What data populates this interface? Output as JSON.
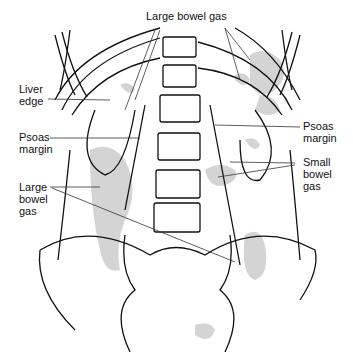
{
  "diagram": {
    "type": "anatomical line drawing - abdominal radiograph",
    "labels": {
      "large_bowel_gas_top": "Large bowel gas",
      "liver_edge_1": "Liver",
      "liver_edge_2": "edge",
      "psoas_left_1": "Psoas",
      "psoas_left_2": "margin",
      "psoas_right_1": "Psoas",
      "psoas_right_2": "margin",
      "small_bowel_1": "Small",
      "small_bowel_2": "bowel",
      "small_bowel_3": "gas",
      "large_bowel_left_1": "Large",
      "large_bowel_left_2": "bowel",
      "large_bowel_left_3": "gas"
    },
    "colors": {
      "line": "#111111",
      "gas": "#cfcfcf"
    }
  }
}
